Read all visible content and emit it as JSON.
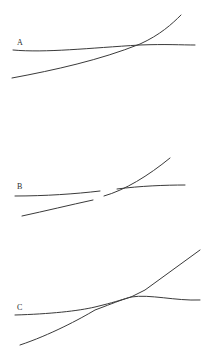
{
  "figure": {
    "width": 220,
    "height": 357,
    "background_color": "#ffffff",
    "stroke_color": "#3a3a3a",
    "label_color": "#2b2b2b",
    "stroke_width": 1
  },
  "panels": [
    {
      "id": "A",
      "label": "A",
      "label_x": 17,
      "label_y": 45,
      "case": "clean-crossing",
      "curves": [
        {
          "name": "near-horizontal-curve",
          "path": "M 13 50 C 45 53 90 48 140 45 C 165 44 182 45 195 45",
          "start": [
            13,
            50
          ],
          "end": [
            195,
            45
          ]
        },
        {
          "name": "rising-curve",
          "path": "M 12 78 C 55 70 100 60 140 44 C 160 35 172 24 181 15",
          "start": [
            12,
            78
          ],
          "end": [
            181,
            15
          ]
        }
      ],
      "crossing_points": [
        [
          128,
          46
        ]
      ]
    },
    {
      "id": "B",
      "label": "B",
      "label_x": 17,
      "label_y": 189,
      "case": "broken-crossing-with-gaps",
      "curves": [
        {
          "name": "near-horizontal-segment-left",
          "path": "M 15 196 C 45 196 75 194 100 191",
          "start": [
            15,
            196
          ],
          "end": [
            100,
            191
          ]
        },
        {
          "name": "near-horizontal-segment-right",
          "path": "M 117 189 C 140 186 165 185 185 185",
          "start": [
            117,
            189
          ],
          "end": [
            185,
            185
          ]
        },
        {
          "name": "rising-segment-left",
          "path": "M 22 216 C 45 211 70 205 93 200",
          "start": [
            22,
            216
          ],
          "end": [
            93,
            200
          ]
        },
        {
          "name": "rising-segment-right",
          "path": "M 104 196 C 125 190 148 176 170 158",
          "start": [
            104,
            196
          ],
          "end": [
            170,
            158
          ]
        }
      ],
      "gaps": [
        {
          "name": "horizontal-gap",
          "from": [
            100,
            191
          ],
          "to": [
            117,
            189
          ]
        },
        {
          "name": "rising-gap",
          "from": [
            93,
            200
          ],
          "to": [
            104,
            196
          ]
        }
      ]
    },
    {
      "id": "C",
      "label": "C",
      "label_x": 17,
      "label_y": 310,
      "case": "merging-tangency-with-kinks",
      "curves": [
        {
          "name": "near-horizontal-curve",
          "path": "M 15 315 C 50 314 78 311 95 307 L 103 305 C 115 302 124 299 131 297 C 150 294 175 301 200 300",
          "start": [
            15,
            315
          ],
          "end": [
            200,
            300
          ]
        },
        {
          "name": "rising-curve",
          "path": "M 20 345 C 50 335 80 319 95 310 L 103 307 C 116 302 124 299 131 297 L 145 290 L 200 250",
          "start": [
            20,
            345
          ],
          "end": [
            200,
            250
          ]
        }
      ],
      "kink_points": [
        [
          95,
          308
        ],
        [
          103,
          306
        ],
        [
          131,
          297
        ],
        [
          145,
          290
        ]
      ],
      "merge_segments": [
        {
          "name": "first-touch",
          "from": [
            95,
            308
          ],
          "to": [
            103,
            306
          ]
        },
        {
          "name": "second-touch",
          "from": [
            125,
            299
          ],
          "to": [
            133,
            297
          ]
        }
      ]
    }
  ]
}
